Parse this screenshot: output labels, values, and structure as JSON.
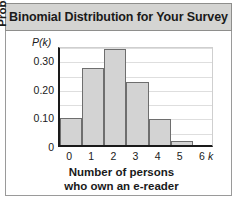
{
  "chart_data": {
    "type": "bar",
    "title": "Binomial Distribution for Your Survey",
    "xlabel_line1": "Number of persons",
    "xlabel_line2": "who own an e-reader",
    "ylabel": "Probability",
    "y_axis_symbol": "P(k)",
    "x_axis_symbol": "k",
    "categories": [
      "0",
      "1",
      "2",
      "3",
      "4",
      "5",
      "6"
    ],
    "values": [
      0.095,
      0.27,
      0.335,
      0.22,
      0.09,
      0.015,
      0.0
    ],
    "ytick_labels": [
      "0",
      "0.10",
      "0.20",
      "0.30"
    ],
    "ytick_values": [
      0,
      0.1,
      0.2,
      0.3
    ],
    "ylim": [
      0,
      0.35
    ],
    "xlim": [
      -0.5,
      6.5
    ],
    "grid": true,
    "grid_step": 0.05,
    "legend": "none",
    "bar_fill_color": "#d3d3d3",
    "bar_edge_color": "#6e6e6e",
    "axis_color": "#1a1a1a",
    "grid_color": "#dedede",
    "title_band_color": "#d4d4d2",
    "background_color": "#ffffff"
  }
}
